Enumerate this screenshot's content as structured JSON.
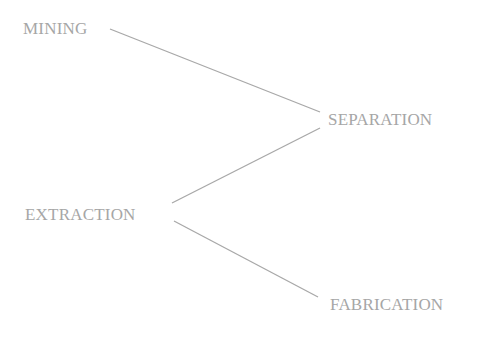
{
  "diagram": {
    "type": "flow",
    "nodes": [
      {
        "id": "mining",
        "label": "MINING"
      },
      {
        "id": "separation",
        "label": "SEPARATION"
      },
      {
        "id": "extraction",
        "label": "EXTRACTION"
      },
      {
        "id": "fabrication",
        "label": "FABRICATION"
      }
    ],
    "edges": [
      {
        "from": "mining",
        "to": "separation"
      },
      {
        "from": "separation",
        "to": "extraction"
      },
      {
        "from": "extraction",
        "to": "fabrication"
      }
    ]
  },
  "colors": {
    "text": "#a6a6a6",
    "line": "#a8a8a8",
    "background": "#ffffff"
  }
}
